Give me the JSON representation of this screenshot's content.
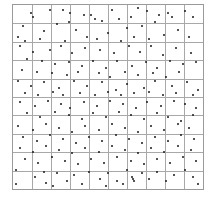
{
  "chart_data": {
    "type": "scatter",
    "title": "",
    "xlabel": "",
    "ylabel": "",
    "xlim": [
      0,
      10
    ],
    "ylim": [
      0,
      10
    ],
    "grid": {
      "on": true,
      "cols": 10,
      "rows": 10
    },
    "legend": null,
    "point_color": "#1a1a1a",
    "grid_color": "#a8a8a8",
    "note": "Random point pattern over a 10x10 quadrat grid; coordinates estimated (x right, y down from top-left).",
    "points": [
      [
        0.9,
        0.4
      ],
      [
        2.6,
        0.2
      ],
      [
        3.7,
        0.5
      ],
      [
        4.3,
        0.7
      ],
      [
        4.7,
        0.8
      ],
      [
        6.6,
        0.1
      ],
      [
        7.1,
        0.3
      ],
      [
        8.2,
        0.4
      ],
      [
        9.1,
        0.3
      ],
      [
        9.5,
        0.6
      ],
      [
        0.5,
        1.1
      ],
      [
        1.6,
        1.4
      ],
      [
        2.9,
        0.9
      ],
      [
        3.3,
        1.3
      ],
      [
        5.0,
        1.5
      ],
      [
        5.6,
        0.7
      ],
      [
        6.0,
        1.2
      ],
      [
        6.8,
        1.1
      ],
      [
        7.7,
        0.5
      ],
      [
        8.4,
        0.6
      ],
      [
        1.0,
        0.6
      ],
      [
        1.9,
        0.2
      ],
      [
        4.1,
        0.5
      ],
      [
        5.2,
        0.2
      ],
      [
        6.2,
        0.6
      ],
      [
        7.5,
        0.9
      ],
      [
        8.7,
        1.3
      ],
      [
        3.0,
        0.4
      ],
      [
        0.2,
        1.7
      ],
      [
        2.3,
        1.0
      ],
      [
        3.9,
        1.7
      ],
      [
        4.4,
        1.8
      ],
      [
        5.7,
        1.9
      ],
      [
        6.4,
        1.7
      ],
      [
        7.2,
        1.8
      ],
      [
        8.0,
        1.6
      ],
      [
        9.3,
        1.7
      ],
      [
        0.6,
        1.9
      ],
      [
        1.4,
        1.8
      ],
      [
        2.7,
        1.9
      ],
      [
        0.3,
        2.2
      ],
      [
        1.0,
        2.5
      ],
      [
        1.9,
        2.4
      ],
      [
        2.5,
        2.2
      ],
      [
        3.1,
        2.6
      ],
      [
        3.8,
        2.3
      ],
      [
        4.6,
        2.4
      ],
      [
        5.3,
        2.6
      ],
      [
        6.1,
        2.2
      ],
      [
        6.7,
        2.5
      ],
      [
        7.3,
        2.2
      ],
      [
        7.9,
        2.7
      ],
      [
        8.6,
        2.3
      ],
      [
        9.4,
        2.6
      ],
      [
        0.7,
        2.9
      ],
      [
        1.5,
        3.0
      ],
      [
        2.2,
        3.2
      ],
      [
        2.9,
        3.1
      ],
      [
        3.6,
        3.3
      ],
      [
        4.2,
        3.0
      ],
      [
        4.9,
        3.4
      ],
      [
        5.5,
        3.0
      ],
      [
        6.3,
        3.3
      ],
      [
        7.0,
        3.1
      ],
      [
        7.6,
        3.4
      ],
      [
        8.3,
        3.0
      ],
      [
        9.0,
        3.2
      ],
      [
        9.7,
        3.1
      ],
      [
        0.4,
        3.5
      ],
      [
        1.2,
        3.6
      ],
      [
        2.0,
        3.7
      ],
      [
        2.8,
        3.8
      ],
      [
        3.4,
        3.6
      ],
      [
        4.5,
        3.7
      ],
      [
        5.1,
        3.9
      ],
      [
        5.9,
        3.6
      ],
      [
        6.6,
        3.8
      ],
      [
        7.4,
        3.7
      ],
      [
        8.1,
        3.9
      ],
      [
        8.8,
        3.6
      ],
      [
        0.2,
        4.1
      ],
      [
        0.9,
        4.4
      ],
      [
        1.6,
        4.2
      ],
      [
        2.4,
        4.5
      ],
      [
        3.2,
        4.1
      ],
      [
        3.9,
        4.4
      ],
      [
        4.7,
        4.2
      ],
      [
        5.4,
        4.6
      ],
      [
        6.0,
        4.3
      ],
      [
        6.9,
        4.5
      ],
      [
        7.5,
        4.1
      ],
      [
        8.4,
        4.4
      ],
      [
        9.2,
        4.2
      ],
      [
        9.8,
        4.6
      ],
      [
        0.6,
        4.8
      ],
      [
        1.3,
        4.9
      ],
      [
        2.1,
        4.7
      ],
      [
        2.6,
        4.9
      ],
      [
        3.5,
        4.8
      ],
      [
        4.3,
        4.9
      ],
      [
        5.0,
        4.7
      ],
      [
        5.7,
        4.9
      ],
      [
        6.4,
        4.8
      ],
      [
        7.2,
        4.7
      ],
      [
        7.9,
        4.9
      ],
      [
        8.6,
        4.8
      ],
      [
        9.5,
        4.9
      ],
      [
        0.3,
        5.3
      ],
      [
        1.1,
        5.5
      ],
      [
        1.8,
        5.2
      ],
      [
        2.5,
        5.4
      ],
      [
        3.0,
        5.6
      ],
      [
        3.7,
        5.3
      ],
      [
        4.4,
        5.5
      ],
      [
        5.1,
        5.2
      ],
      [
        5.8,
        5.4
      ],
      [
        6.5,
        5.6
      ],
      [
        7.1,
        5.3
      ],
      [
        7.8,
        5.5
      ],
      [
        8.5,
        5.2
      ],
      [
        9.1,
        5.4
      ],
      [
        9.7,
        5.6
      ],
      [
        0.7,
        5.9
      ],
      [
        1.4,
        6.1
      ],
      [
        2.2,
        5.8
      ],
      [
        2.9,
        6.0
      ],
      [
        3.6,
        6.2
      ],
      [
        4.2,
        5.9
      ],
      [
        4.9,
        6.1
      ],
      [
        5.6,
        5.8
      ],
      [
        6.2,
        6.0
      ],
      [
        6.9,
        6.2
      ],
      [
        7.6,
        5.9
      ],
      [
        8.2,
        6.1
      ],
      [
        8.9,
        6.3
      ],
      [
        9.5,
        6.0
      ],
      [
        0.2,
        6.6
      ],
      [
        1.0,
        6.8
      ],
      [
        1.7,
        6.5
      ],
      [
        2.4,
        6.7
      ],
      [
        3.1,
        6.9
      ],
      [
        3.8,
        6.6
      ],
      [
        4.5,
        6.8
      ],
      [
        5.2,
        6.5
      ],
      [
        5.9,
        6.7
      ],
      [
        6.6,
        6.9
      ],
      [
        7.3,
        6.6
      ],
      [
        8.0,
        6.8
      ],
      [
        8.7,
        6.5
      ],
      [
        9.3,
        6.7
      ],
      [
        0.5,
        7.2
      ],
      [
        1.2,
        7.4
      ],
      [
        1.9,
        7.1
      ],
      [
        2.6,
        7.3
      ],
      [
        3.3,
        7.5
      ],
      [
        4.0,
        7.2
      ],
      [
        4.7,
        7.4
      ],
      [
        5.4,
        7.1
      ],
      [
        6.1,
        7.3
      ],
      [
        6.8,
        7.5
      ],
      [
        7.5,
        7.2
      ],
      [
        8.2,
        7.4
      ],
      [
        8.9,
        7.1
      ],
      [
        9.6,
        7.3
      ],
      [
        0.3,
        7.8
      ],
      [
        1.0,
        8.0
      ],
      [
        1.7,
        7.7
      ],
      [
        2.4,
        7.9
      ],
      [
        3.1,
        8.1
      ],
      [
        3.8,
        7.8
      ],
      [
        4.5,
        8.0
      ],
      [
        5.2,
        7.7
      ],
      [
        5.9,
        7.9
      ],
      [
        6.6,
        8.1
      ],
      [
        7.3,
        7.8
      ],
      [
        8.0,
        8.0
      ],
      [
        8.7,
        7.7
      ],
      [
        9.4,
        7.9
      ],
      [
        0.6,
        8.4
      ],
      [
        1.3,
        8.6
      ],
      [
        2.0,
        8.3
      ],
      [
        2.7,
        8.5
      ],
      [
        3.4,
        8.7
      ],
      [
        4.1,
        8.4
      ],
      [
        4.8,
        8.6
      ],
      [
        5.5,
        8.3
      ],
      [
        6.2,
        8.5
      ],
      [
        6.9,
        8.7
      ],
      [
        7.6,
        8.4
      ],
      [
        8.3,
        8.6
      ],
      [
        9.0,
        8.3
      ],
      [
        9.7,
        8.5
      ],
      [
        0.1,
        9.0
      ],
      [
        0.1,
        9.8
      ],
      [
        1.1,
        9.4
      ],
      [
        1.6,
        9.1
      ],
      [
        1.7,
        9.7
      ],
      [
        2.3,
        9.2
      ],
      [
        2.8,
        9.6
      ],
      [
        3.2,
        9.3
      ],
      [
        3.6,
        9.8
      ],
      [
        4.0,
        9.1
      ],
      [
        4.6,
        9.5
      ],
      [
        5.0,
        9.2
      ],
      [
        5.5,
        9.6
      ],
      [
        6.0,
        9.0
      ],
      [
        6.3,
        9.4
      ],
      [
        6.35,
        9.5
      ],
      [
        6.4,
        9.6
      ],
      [
        6.8,
        9.2
      ],
      [
        7.2,
        9.5
      ],
      [
        7.6,
        9.1
      ],
      [
        8.1,
        9.6
      ],
      [
        8.5,
        9.3
      ],
      [
        9.1,
        9.0
      ],
      [
        9.5,
        9.4
      ],
      [
        9.8,
        9.8
      ],
      [
        4.9,
        9.9
      ],
      [
        5.8,
        9.8
      ],
      [
        2.1,
        9.9
      ]
    ]
  },
  "caption": {
    "text": "",
    "note": "caption line cropped at bottom edge; illegible"
  }
}
